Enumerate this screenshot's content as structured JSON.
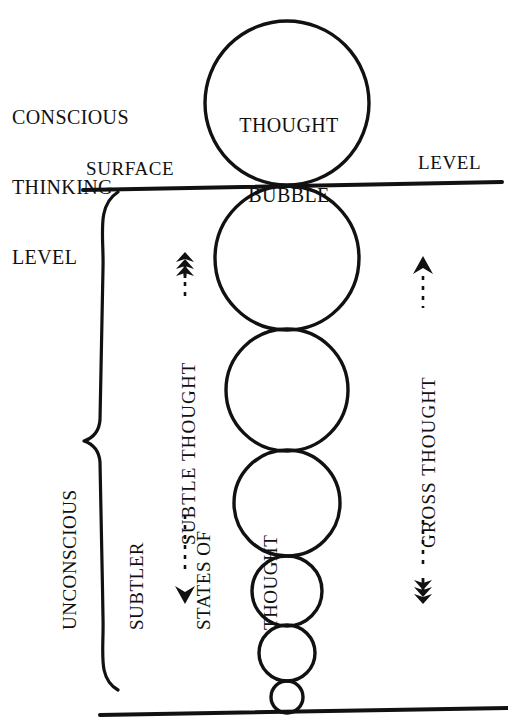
{
  "diagram": {
    "title_label": {
      "name": "conscious-thinking-level",
      "lines": [
        "CONSCIOUS",
        "THINKING",
        "LEVEL"
      ]
    },
    "surface_line": {
      "left_word": "SURFACE",
      "right_word": "LEVEL"
    },
    "bubble": {
      "lines": [
        "THOUGHT",
        "BUBBLE"
      ]
    },
    "brace_label": {
      "lines": [
        "UNCONSCIOUS",
        "SUBTLER",
        "STATES OF",
        "THOUGHT"
      ]
    },
    "axis_labels": {
      "subtle": "-----SUBTLE THOUGHT---",
      "subtle_text": "SUBTLE THOUGHT",
      "gross": "----GROSS THOUGHT---",
      "gross_text": "GROSS THOUGHT"
    },
    "colors": {
      "ink": "#111111",
      "paper": "#ffffff"
    },
    "circles": [
      {
        "cx": 287,
        "cy": 103,
        "r": 82,
        "name": "thought-bubble-circle"
      },
      {
        "cx": 287,
        "cy": 258,
        "r": 72,
        "name": "subtle-circle-1"
      },
      {
        "cx": 287,
        "cy": 390,
        "r": 61,
        "name": "subtle-circle-2"
      },
      {
        "cx": 287,
        "cy": 503,
        "r": 53,
        "name": "subtle-circle-3"
      },
      {
        "cx": 287,
        "cy": 591,
        "r": 35,
        "name": "subtle-circle-4"
      },
      {
        "cx": 287,
        "cy": 653,
        "r": 28,
        "name": "subtle-circle-5"
      },
      {
        "cx": 287,
        "cy": 697,
        "r": 16,
        "name": "subtle-circle-6"
      }
    ]
  }
}
